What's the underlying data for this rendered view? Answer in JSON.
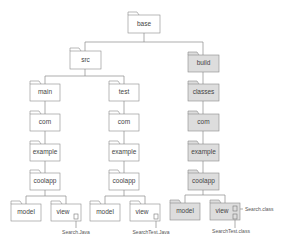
{
  "diagram": {
    "type": "directory-tree",
    "colors": {
      "line": "#8a8a8a",
      "folder_fill": "#ffffff",
      "build_fill": "#dddddd",
      "text": "#444444"
    },
    "folders": [
      {
        "id": "base",
        "label": "base",
        "x": 128,
        "y": 15,
        "w": 32,
        "h": 18,
        "shaded": false
      },
      {
        "id": "src",
        "label": "src",
        "x": 70,
        "y": 51,
        "w": 31,
        "h": 18,
        "shaded": false
      },
      {
        "id": "build",
        "label": "build",
        "x": 188,
        "y": 55,
        "w": 31,
        "h": 17,
        "shaded": true
      },
      {
        "id": "main",
        "label": "main",
        "x": 30,
        "y": 84,
        "w": 30,
        "h": 17,
        "shaded": false
      },
      {
        "id": "test",
        "label": "test",
        "x": 109,
        "y": 84,
        "w": 30,
        "h": 17,
        "shaded": false
      },
      {
        "id": "classes",
        "label": "classes",
        "x": 188,
        "y": 84,
        "w": 31,
        "h": 17,
        "shaded": true
      },
      {
        "id": "com1",
        "label": "com",
        "x": 30,
        "y": 114,
        "w": 30,
        "h": 17,
        "shaded": false
      },
      {
        "id": "com2",
        "label": "com",
        "x": 109,
        "y": 114,
        "w": 30,
        "h": 17,
        "shaded": false
      },
      {
        "id": "com3",
        "label": "com",
        "x": 188,
        "y": 114,
        "w": 31,
        "h": 17,
        "shaded": true
      },
      {
        "id": "example1",
        "label": "example",
        "x": 30,
        "y": 144,
        "w": 30,
        "h": 17,
        "shaded": false
      },
      {
        "id": "example2",
        "label": "example",
        "x": 109,
        "y": 144,
        "w": 30,
        "h": 17,
        "shaded": false
      },
      {
        "id": "example3",
        "label": "example",
        "x": 188,
        "y": 144,
        "w": 31,
        "h": 17,
        "shaded": true
      },
      {
        "id": "coolapp1",
        "label": "coolapp",
        "x": 30,
        "y": 173,
        "w": 30,
        "h": 17,
        "shaded": false
      },
      {
        "id": "coolapp2",
        "label": "coolapp",
        "x": 109,
        "y": 173,
        "w": 30,
        "h": 17,
        "shaded": false
      },
      {
        "id": "coolapp3",
        "label": "coolapp",
        "x": 188,
        "y": 173,
        "w": 31,
        "h": 17,
        "shaded": true
      },
      {
        "id": "model1",
        "label": "model",
        "x": 11,
        "y": 204,
        "w": 30,
        "h": 17,
        "shaded": false
      },
      {
        "id": "view1",
        "label": "view",
        "x": 51,
        "y": 204,
        "w": 30,
        "h": 17,
        "shaded": false
      },
      {
        "id": "model2",
        "label": "model",
        "x": 90,
        "y": 204,
        "w": 30,
        "h": 17,
        "shaded": false
      },
      {
        "id": "view2",
        "label": "view",
        "x": 130,
        "y": 204,
        "w": 30,
        "h": 17,
        "shaded": false
      },
      {
        "id": "model3",
        "label": "model",
        "x": 170,
        "y": 203,
        "w": 30,
        "h": 17,
        "shaded": true
      },
      {
        "id": "view3",
        "label": "view",
        "x": 210,
        "y": 203,
        "w": 30,
        "h": 17,
        "shaded": true
      }
    ],
    "files": [
      {
        "label": "Search.Java",
        "parent": "view1"
      },
      {
        "label": "SearchTest.Java",
        "parent": "view2"
      },
      {
        "label": "Search.class",
        "parent": "view3"
      },
      {
        "label": "SearchTest.class",
        "parent": "view3"
      }
    ]
  }
}
